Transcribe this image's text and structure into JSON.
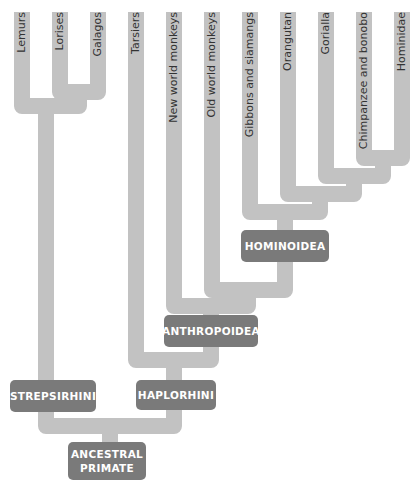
{
  "colors": {
    "branch": "#c2c2c2",
    "node_box": "#7a7a7a",
    "node_text": "#ffffff",
    "leaf_text": "#333333"
  },
  "leaves": [
    {
      "label": "Lemurs"
    },
    {
      "label": "Lorises"
    },
    {
      "label": "Galagos"
    },
    {
      "label": "Tarsiers"
    },
    {
      "label": "New world monkeys"
    },
    {
      "label": "Old world monkeys"
    },
    {
      "label": "Gibbons and siamangs"
    },
    {
      "label": "Orangutan"
    },
    {
      "label": "Gorialla"
    },
    {
      "label": "Chimpanzee and bonobo"
    },
    {
      "label": "Hominidae"
    }
  ],
  "nodes": {
    "hominoidea": "HOMINOIDEA",
    "anthropoidea": "ANTHROPOIDEA",
    "haplorhini": "HAPLORHINI",
    "strepsirhini": "STREPSIRHINI",
    "ancestral_line1": "ANCESTRAL",
    "ancestral_line2": "PRIMATE"
  }
}
